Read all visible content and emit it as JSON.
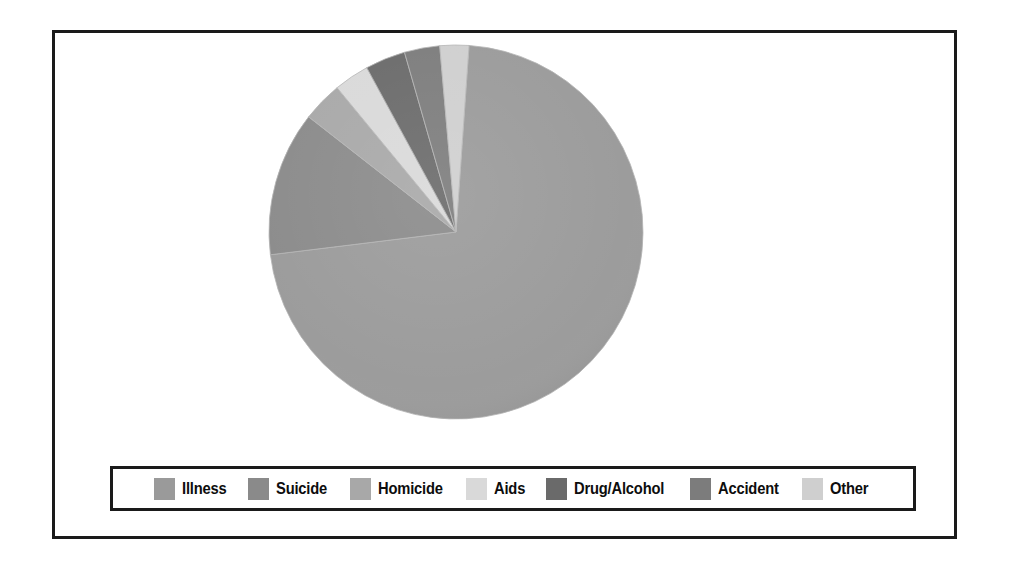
{
  "chart_data": {
    "type": "pie",
    "title": "",
    "legend_position": "bottom",
    "categories": [
      "Illness",
      "Suicide",
      "Homicide",
      "Aids",
      "Drug/Alcohol",
      "Accident",
      "Other"
    ],
    "values": [
      72.0,
      12.5,
      3.5,
      3.0,
      3.5,
      3.0,
      2.5
    ],
    "unit": "percent",
    "colors": [
      "#9a9a9a",
      "#8a8a8a",
      "#a8a8a8",
      "#d9d9d9",
      "#6a6a6a",
      "#7c7c7c",
      "#cfcfcf"
    ],
    "slice_order_clockwise_from_top": [
      "Other",
      "Illness",
      "Suicide",
      "Homicide",
      "Aids",
      "Drug/Alcohol",
      "Accident"
    ],
    "slices": [
      {
        "label": "Illness",
        "value": 72.0,
        "color": "#9a9a9a",
        "start_angle": 4.0,
        "end_angle": 263.0
      },
      {
        "label": "Suicide",
        "value": 12.5,
        "color": "#8a8a8a",
        "start_angle": 263.0,
        "end_angle": 308.0
      },
      {
        "label": "Homicide",
        "value": 3.5,
        "color": "#a8a8a8",
        "start_angle": 308.0,
        "end_angle": 320.5
      },
      {
        "label": "Aids",
        "value": 3.0,
        "color": "#d9d9d9",
        "start_angle": 320.5,
        "end_angle": 331.5
      },
      {
        "label": "Drug/Alcohol",
        "value": 3.5,
        "color": "#6a6a6a",
        "start_angle": 331.5,
        "end_angle": 344.0
      },
      {
        "label": "Accident",
        "value": 3.0,
        "color": "#7c7c7c",
        "start_angle": 344.0,
        "end_angle": 355.0
      },
      {
        "label": "Other",
        "value": 2.5,
        "color": "#cfcfcf",
        "start_angle": 355.0,
        "end_angle": 364.0
      }
    ],
    "geometry": {
      "cx": 190,
      "cy": 190,
      "r": 187
    }
  },
  "legend": {
    "items": [
      {
        "label": "Illness",
        "color": "#9a9a9a"
      },
      {
        "label": "Suicide",
        "color": "#8a8a8a"
      },
      {
        "label": "Homicide",
        "color": "#a8a8a8"
      },
      {
        "label": "Aids",
        "color": "#d9d9d9"
      },
      {
        "label": "Drug/Alcohol",
        "color": "#6a6a6a"
      },
      {
        "label": "Accident",
        "color": "#7c7c7c"
      },
      {
        "label": "Other",
        "color": "#cfcfcf"
      }
    ]
  },
  "frame": {
    "border_color": "#1a1a1a",
    "background": "#ffffff"
  }
}
